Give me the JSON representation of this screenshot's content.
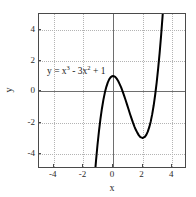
{
  "chart_data": {
    "type": "line",
    "title": "",
    "xlabel": "x",
    "ylabel": "y",
    "annotation": "y = x³ - 3x² + 1",
    "equation": {
      "lhs": "y",
      "equals": "=",
      "term1_base": "x",
      "term1_exp": "3",
      "minus": "-",
      "term2_coef": "3x",
      "term2_exp": "2",
      "plus": "+",
      "constant": "1"
    },
    "function": "y = x^3 - 3*x^2 + 1",
    "xlim": [
      -5,
      5
    ],
    "ylim": [
      -5,
      5
    ],
    "grid": true,
    "legend": "none",
    "xticks": [
      -4,
      -2,
      0,
      2,
      4
    ],
    "xtick_labels": [
      "-4",
      "-2",
      "0",
      "2",
      "4"
    ],
    "yticks": [
      -4,
      -2,
      0,
      2,
      4
    ],
    "ytick_labels": [
      "-4",
      "-2",
      "0",
      "2",
      "4"
    ],
    "colors": {
      "curve": "#000000",
      "frame": "#4a4a4a",
      "grid": "#b4b4b4",
      "zero_axis": "#6e6e6e",
      "background": "#ffffff"
    },
    "features": {
      "local_maximum": [
        0,
        1
      ],
      "local_minimum": [
        2,
        -3
      ],
      "inflection_point": [
        1,
        -1
      ]
    },
    "x": [
      -1.31,
      -1.25,
      -1.15,
      -1.05,
      -0.95,
      -0.85,
      -0.75,
      -0.65,
      -0.55,
      -0.45,
      -0.35,
      -0.25,
      -0.15,
      -0.05,
      0,
      0.05,
      0.15,
      0.25,
      0.35,
      0.45,
      0.55,
      0.65,
      0.75,
      0.85,
      0.95,
      1.05,
      1.15,
      1.25,
      1.35,
      1.45,
      1.55,
      1.65,
      1.75,
      1.85,
      1.95,
      2,
      2.05,
      2.15,
      2.25,
      2.35,
      2.45,
      2.55,
      2.65,
      2.75,
      2.85,
      2.95,
      3.05,
      3.15,
      3.25,
      3.35,
      3.45,
      3.5
    ],
    "y": [
      -6.39,
      -5.64,
      -4.49,
      -3.47,
      -2.57,
      -1.78,
      -1.11,
      -0.54,
      -0.07,
      0.3,
      0.59,
      0.8,
      0.93,
      0.99,
      1,
      0.99,
      0.94,
      0.83,
      0.68,
      0.48,
      0.26,
      0.01,
      -0.27,
      -0.55,
      -0.85,
      -1.15,
      -1.45,
      -1.73,
      -2.01,
      -2.26,
      -2.49,
      -2.67,
      -2.83,
      -2.94,
      -2.98,
      -3,
      -2.98,
      -2.93,
      -2.8,
      -2.59,
      -2.3,
      -1.93,
      -1.46,
      -0.89,
      -0.21,
      0.57,
      1.47,
      2.48,
      3.61,
      4.86,
      6.24,
      7.13
    ],
    "axis_titles": {
      "x": "x",
      "y": "y"
    }
  },
  "figure": {
    "width": 196,
    "height": 197
  }
}
